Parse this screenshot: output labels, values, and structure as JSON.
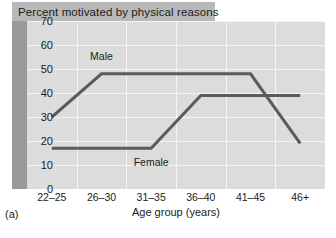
{
  "figure": {
    "title": "Percent motivated by physical reasons",
    "panel_letter": "(a)"
  },
  "chart_data": {
    "type": "line",
    "title": "Percent motivated by physical reasons",
    "xlabel": "Age group (years)",
    "ylabel": "",
    "categories": [
      "22–25",
      "26–30",
      "31–35",
      "36–40",
      "41–45",
      "46+"
    ],
    "ylim": [
      0,
      70
    ],
    "yticks": [
      0,
      10,
      20,
      30,
      40,
      50,
      60,
      70
    ],
    "ytick_labels": [
      "0",
      "10",
      "20",
      "30",
      "40",
      "50",
      "60",
      "70"
    ],
    "grid": true,
    "legend": "inline-labels",
    "series": [
      {
        "name": "Male",
        "values": [
          30,
          48,
          48,
          48,
          48,
          19
        ],
        "color": "#5b5b5b"
      },
      {
        "name": "Female",
        "values": [
          17,
          17,
          17,
          39,
          39,
          39
        ],
        "color": "#5b5b5b"
      }
    ],
    "annotations": [
      {
        "text": "Male",
        "category": "26–30",
        "value": 55
      },
      {
        "text": "Female",
        "category": "31–35",
        "value": 11
      }
    ],
    "colors": {
      "plot_background": "#dcdcdc",
      "gridline": "#f4f4f4",
      "title_banner": "#b9b9b9",
      "left_rail": "#9a9a9a",
      "line": "#5b5b5b",
      "text": "#1b1b1b"
    }
  }
}
